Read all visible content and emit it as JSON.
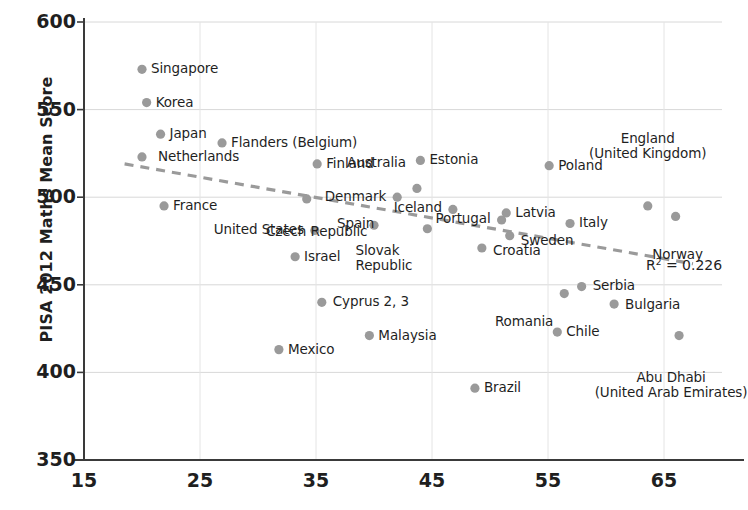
{
  "chart_data": {
    "type": "scatter",
    "title": "",
    "xlabel": "",
    "ylabel": "PISA 2012 Maths Mean Score",
    "xlim": [
      15,
      70
    ],
    "ylim": [
      350,
      600
    ],
    "xticks": [
      15,
      25,
      35,
      45,
      55,
      65
    ],
    "yticks": [
      350,
      400,
      450,
      500,
      550,
      600
    ],
    "grid": true,
    "legend": "none",
    "marker_color": "#9a9a9a",
    "trendline": {
      "style": "dashed",
      "color": "#9a9a9a",
      "annotation": "R",
      "annotation_sup": "2",
      "annotation_rest": " = 0.226",
      "r_squared": 0.226
    },
    "points": [
      {
        "name": "Singapore",
        "x": 20.0,
        "y": 573,
        "label_pos": "right"
      },
      {
        "name": "Korea",
        "x": 20.4,
        "y": 554,
        "label_pos": "right"
      },
      {
        "name": "Japan",
        "x": 21.6,
        "y": 536,
        "label_pos": "right"
      },
      {
        "name": "Netherlands",
        "x": 20.0,
        "y": 523,
        "label_pos": "right"
      },
      {
        "name": "Flanders (Belgium)",
        "x": 26.9,
        "y": 531,
        "label_pos": "right"
      },
      {
        "name": "Finland",
        "x": 35.1,
        "y": 519,
        "label_pos": "right"
      },
      {
        "name": "Estonia",
        "x": 44.0,
        "y": 521,
        "label_pos": "right"
      },
      {
        "name": "Poland",
        "x": 55.1,
        "y": 518,
        "label_pos": "right"
      },
      {
        "name": "England\n(United Kingdom)",
        "x": 63.6,
        "y": 495,
        "label_pos": "above"
      },
      {
        "name": "France",
        "x": 21.9,
        "y": 495,
        "label_pos": "right"
      },
      {
        "name": "Czech Republic",
        "x": 34.2,
        "y": 499,
        "label_pos": "below"
      },
      {
        "name": "Australia",
        "x": 43.7,
        "y": 505,
        "label_pos": "above-left"
      },
      {
        "name": "Denmark",
        "x": 42.0,
        "y": 500,
        "label_pos": "left"
      },
      {
        "name": "United States",
        "x": 34.9,
        "y": 481,
        "label_pos": "left"
      },
      {
        "name": "Spain",
        "x": 40.0,
        "y": 484,
        "label_pos": "right"
      },
      {
        "name": "Iceland",
        "x": 46.8,
        "y": 493,
        "label_pos": "left"
      },
      {
        "name": "Latvia",
        "x": 51.4,
        "y": 491,
        "label_pos": "right"
      },
      {
        "name": "Portugal",
        "x": 51.0,
        "y": 487,
        "label_pos": "left"
      },
      {
        "name": "Italy",
        "x": 56.9,
        "y": 485,
        "label_pos": "right"
      },
      {
        "name": "Norway",
        "x": 66.0,
        "y": 489,
        "label_pos": "below"
      },
      {
        "name": "Sweden",
        "x": 51.7,
        "y": 478,
        "label_pos": "right"
      },
      {
        "name": "Slovak\nRepublic",
        "x": 44.6,
        "y": 482,
        "label_pos": "below-left"
      },
      {
        "name": "Croatia",
        "x": 49.3,
        "y": 471,
        "label_pos": "right"
      },
      {
        "name": "Israel",
        "x": 33.2,
        "y": 466,
        "label_pos": "right"
      },
      {
        "name": "Serbia",
        "x": 57.9,
        "y": 449,
        "label_pos": "right"
      },
      {
        "name": "Romania",
        "x": 56.4,
        "y": 445,
        "label_pos": "below-left"
      },
      {
        "name": "Bulgaria",
        "x": 60.7,
        "y": 439,
        "label_pos": "right"
      },
      {
        "name": "Cyprus 2, 3",
        "x": 35.5,
        "y": 440,
        "label_pos": "right"
      },
      {
        "name": "Chile",
        "x": 55.8,
        "y": 423,
        "label_pos": "right"
      },
      {
        "name": "Abu Dhabi\n(United Arab Emirates)",
        "x": 66.3,
        "y": 421,
        "label_pos": "below"
      },
      {
        "name": "Malaysia",
        "x": 39.6,
        "y": 421,
        "label_pos": "right"
      },
      {
        "name": "Mexico",
        "x": 31.8,
        "y": 413,
        "label_pos": "right"
      },
      {
        "name": "Brazil",
        "x": 48.7,
        "y": 391,
        "label_pos": "right"
      }
    ]
  }
}
